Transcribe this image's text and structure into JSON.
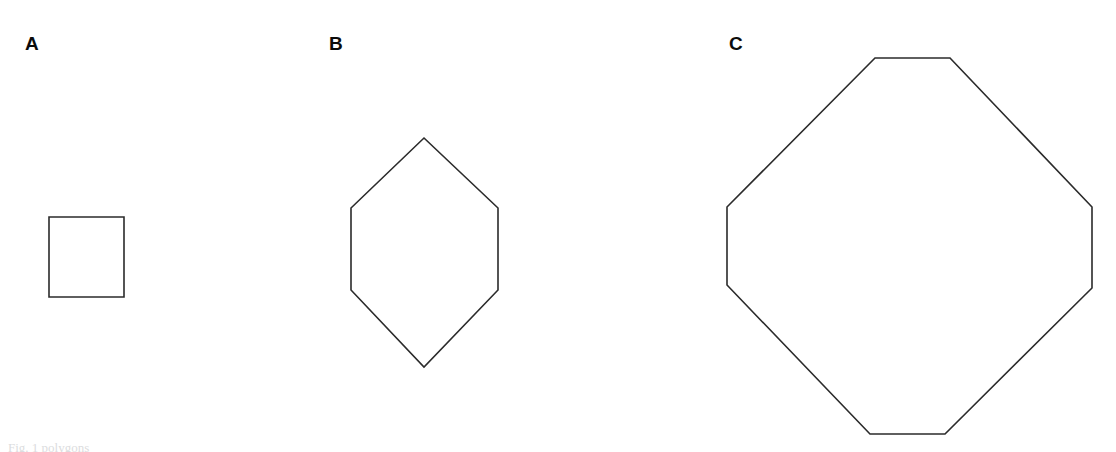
{
  "figure": {
    "background_color": "#ffffff",
    "stroke_color": "#2b2b2b",
    "label_color": "#0b0b0b",
    "width": 1116,
    "height": 452
  },
  "panels": [
    {
      "label": "A",
      "shape_name": "square",
      "sides": 4,
      "points": "49,217 124,217 124,297 49,297"
    },
    {
      "label": "B",
      "shape_name": "hexagon",
      "sides": 6,
      "points": "424,138 498,208 498,290 424,367 351,290 351,208"
    },
    {
      "label": "C",
      "shape_name": "octagon",
      "sides": 8,
      "points": "875,58 950,58 1092,207 1092,288 945,434 870,434 727,285 727,207"
    }
  ],
  "clipped_text": {
    "top": "of",
    "bottom": "Fig. 1 polygons"
  }
}
